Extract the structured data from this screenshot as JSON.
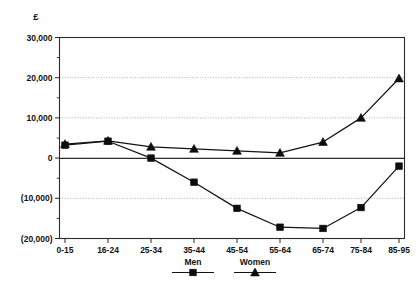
{
  "chart_data": {
    "type": "line",
    "title": "",
    "subtitle": "",
    "xlabel": "",
    "ylabel": "£",
    "unit_label": "£",
    "categories": [
      "0-15",
      "16-24",
      "25-34",
      "35-44",
      "45-54",
      "55-64",
      "65-74",
      "75-84",
      "85-95"
    ],
    "series": [
      {
        "name": "Men",
        "marker": "square",
        "color": "#0d0d0d",
        "values": [
          3200,
          4200,
          0,
          -6000,
          -12500,
          -17200,
          -17500,
          -12300,
          -2000
        ]
      },
      {
        "name": "Women",
        "marker": "triangle",
        "color": "#0d0d0d",
        "values": [
          3500,
          4300,
          2800,
          2300,
          1800,
          1300,
          4000,
          10000,
          19800
        ]
      }
    ],
    "ylim": [
      -20000,
      30000
    ],
    "ytick_values": [
      30000,
      20000,
      10000,
      0,
      -10000,
      -20000
    ],
    "ytick_labels": [
      "30,000",
      "20,000",
      "10,000",
      "0",
      "(10,000)",
      "(20,000)"
    ],
    "yminor_step": 5000,
    "grid": "horizontal-dotted",
    "gridline_values": [
      20000,
      10000,
      -10000
    ],
    "legend_position": "bottom-center",
    "legend_entries": [
      {
        "label": "Men",
        "marker": "square"
      },
      {
        "label": "Women",
        "marker": "triangle"
      }
    ]
  },
  "axis": {
    "unit": "£",
    "y_labels": [
      "30,000",
      "20,000",
      "10,000",
      "0",
      "(10,000)",
      "(20,000)"
    ],
    "x_labels": [
      "0-15",
      "16-24",
      "25-34",
      "35-44",
      "45-54",
      "55-64",
      "65-74",
      "75-84",
      "85-95"
    ]
  },
  "legend": {
    "men_label": "Men",
    "women_label": "Women"
  }
}
